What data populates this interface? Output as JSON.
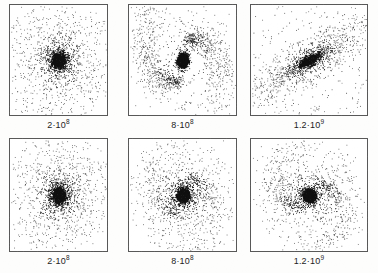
{
  "figure": {
    "title": "",
    "background_color": "#fdfdfc",
    "frame_color": "#585858",
    "point_color": "#111111",
    "rows": 2,
    "columns": 3
  },
  "panels": [
    {
      "id": "panel-top-left",
      "row": 0,
      "column": 0,
      "label": "2·10",
      "label_exponent": "8",
      "label_full": "2·10^8",
      "morphology": "round-concentrated-blob",
      "x": 9,
      "y": 4,
      "width": 99,
      "height": 112,
      "points": 2100,
      "seed": 11,
      "core_density": 0.95,
      "scale_x": 0.3,
      "scale_y": 0.3,
      "rotation_deg": 0,
      "arms": 0,
      "arm_strength": 0,
      "halo_points": 40,
      "halo_spread": 0.48
    },
    {
      "id": "panel-top-middle",
      "row": 0,
      "column": 1,
      "label": "8·10",
      "label_exponent": "8",
      "label_full": "8·10^8",
      "morphology": "s-shaped-two-arm-spiral",
      "x": 128,
      "y": 4,
      "width": 109,
      "height": 112,
      "points": 2300,
      "seed": 27,
      "core_density": 0.7,
      "scale_x": 0.2,
      "scale_y": 0.27,
      "rotation_deg": 8,
      "arms": 2,
      "arm_strength": 0.92,
      "arm_winding": 2.1,
      "arm_radius": 0.4,
      "halo_points": 150,
      "halo_spread": 0.46
    },
    {
      "id": "panel-top-right",
      "row": 0,
      "column": 2,
      "label": "1.2·10",
      "label_exponent": "9",
      "label_full": "1.2·10^9",
      "morphology": "elongated-diagonal-bar",
      "x": 250,
      "y": 4,
      "width": 118,
      "height": 112,
      "points": 1900,
      "seed": 43,
      "core_density": 0.75,
      "scale_x": 0.4,
      "scale_y": 0.1,
      "rotation_deg": -32,
      "arms": 0,
      "arm_strength": 0,
      "halo_points": 320,
      "halo_spread": 0.62
    },
    {
      "id": "panel-bottom-left",
      "row": 1,
      "column": 0,
      "label": "2·10",
      "label_exponent": "8",
      "label_full": "2·10^8",
      "morphology": "round-concentrated-blob",
      "x": 9,
      "y": 138,
      "width": 99,
      "height": 114,
      "points": 2200,
      "seed": 59,
      "core_density": 0.95,
      "scale_x": 0.29,
      "scale_y": 0.29,
      "rotation_deg": 0,
      "arms": 0,
      "arm_strength": 0,
      "halo_points": 40,
      "halo_spread": 0.47
    },
    {
      "id": "panel-bottom-middle",
      "row": 1,
      "column": 1,
      "label": "8·10",
      "label_exponent": "8",
      "label_full": "8·10^8",
      "morphology": "dense-nucleus-ring-disk",
      "x": 128,
      "y": 138,
      "width": 109,
      "height": 114,
      "points": 2250,
      "seed": 71,
      "core_density": 0.99,
      "scale_x": 0.26,
      "scale_y": 0.27,
      "rotation_deg": -12,
      "arms": 2,
      "arm_strength": 0.38,
      "arm_winding": 3.0,
      "arm_radius": 0.26,
      "halo_points": 70,
      "halo_spread": 0.42
    },
    {
      "id": "panel-bottom-right",
      "row": 1,
      "column": 2,
      "label": "1.2·10",
      "label_exponent": "9",
      "label_full": "1.2·10^9",
      "morphology": "compact-nucleus-spiral",
      "x": 250,
      "y": 138,
      "width": 118,
      "height": 114,
      "points": 2150,
      "seed": 97,
      "core_density": 0.97,
      "scale_x": 0.25,
      "scale_y": 0.24,
      "rotation_deg": 20,
      "arms": 2,
      "arm_strength": 0.45,
      "arm_winding": 2.6,
      "arm_radius": 0.28,
      "halo_points": 90,
      "halo_spread": 0.44
    }
  ],
  "labels": {
    "top_row": [
      "2·10^8",
      "8·10^8",
      "1.2·10^9"
    ],
    "bottom_row": [
      "2·10^8",
      "8·10^8",
      "1.2·10^9"
    ]
  },
  "chart_data": {
    "type": "scatter",
    "title": "",
    "xlabel": "",
    "ylabel": "",
    "grid": false,
    "legend": null,
    "panel_layout": {
      "rows": 2,
      "columns": 3
    },
    "time_labels": [
      "2·10^8",
      "8·10^8",
      "1.2·10^9",
      "2·10^8",
      "8·10^8",
      "1.2·10^9"
    ],
    "series": [
      {
        "name": "2·10^8 (top)",
        "approx_point_count": 2140,
        "structure": "round-concentrated-blob"
      },
      {
        "name": "8·10^8 (top)",
        "approx_point_count": 2450,
        "structure": "s-shaped-two-arm-spiral"
      },
      {
        "name": "1.2·10^9 (top)",
        "approx_point_count": 2220,
        "structure": "elongated-diagonal-bar"
      },
      {
        "name": "2·10^8 (bottom)",
        "approx_point_count": 2240,
        "structure": "round-concentrated-blob"
      },
      {
        "name": "8·10^8 (bottom)",
        "approx_point_count": 2320,
        "structure": "dense-nucleus-ring-disk"
      },
      {
        "name": "1.2·10^9 (bottom)",
        "approx_point_count": 2240,
        "structure": "compact-nucleus-spiral"
      }
    ],
    "axis_ranges": {
      "x": [
        -1,
        1
      ],
      "y": [
        -1,
        1
      ]
    }
  }
}
